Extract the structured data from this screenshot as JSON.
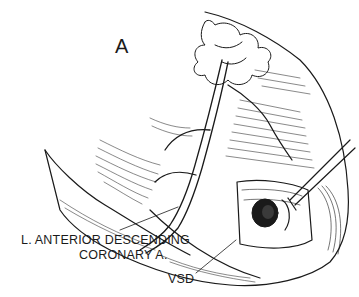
{
  "figure": {
    "panel_label": "A",
    "labels": {
      "lad_line1": "L. ANTERIOR DESCENDING",
      "lad_line2": "CORONARY A.",
      "vsd": "VSD"
    },
    "colors": {
      "ink": "#1a1a1a",
      "background": "#ffffff"
    }
  }
}
